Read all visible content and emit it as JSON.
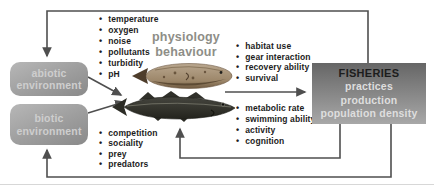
{
  "diagram": {
    "boxes": {
      "abiotic": {
        "line1": "abiotic",
        "line2": "environment"
      },
      "biotic": {
        "line1": "biotic",
        "line2": "environment"
      },
      "fisheries": {
        "title": "FISHERIES",
        "items": [
          "practices",
          "production",
          "population density"
        ]
      }
    },
    "center_label": {
      "line1": "physiology",
      "line2": "behaviour"
    },
    "lists": {
      "abiotic_factors": [
        "temperature",
        "oxygen",
        "noise",
        "pollutants",
        "turbidity",
        "pH"
      ],
      "biotic_factors": [
        "competition",
        "sociality",
        "prey",
        "predators"
      ],
      "fishery_traits": [
        "habitat use",
        "gear interaction",
        "recovery ability",
        "survival"
      ],
      "performance_traits": [
        "metabolic rate",
        "swimming ability",
        "activity",
        "cognition"
      ]
    },
    "images": {
      "top_fish": "plaice-flatfish",
      "bottom_fish": "atlantic-cod"
    },
    "colors": {
      "env_box_gray": "#9d9d9d",
      "env_box_text": "#cecece",
      "fisheries_box_top": "#666666",
      "fisheries_box_bottom": "#a8a8a8",
      "fisheries_title_text": "#1d1d1d",
      "fisheries_item_text": "#dedede",
      "center_label_text": "#8e8e87",
      "arrow_gray": "#4f4f4f",
      "bullet_text": "#1c1c1c"
    }
  }
}
